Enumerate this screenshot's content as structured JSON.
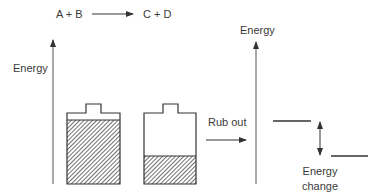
{
  "reaction": {
    "reactants": "A + B",
    "products": "C + D"
  },
  "left_panel": {
    "axis_label": "Energy",
    "batteries": [
      {
        "name": "charged",
        "fill_fraction": 0.9
      },
      {
        "name": "discharged",
        "fill_fraction": 0.39
      }
    ]
  },
  "process_label": "Rub out",
  "right_panel": {
    "axis_label": "Energy",
    "change_label_line1": "Energy",
    "change_label_line2": "change"
  },
  "colors": {
    "stroke": "#333333",
    "text": "#3a3a3a",
    "background": "#ffffff"
  }
}
